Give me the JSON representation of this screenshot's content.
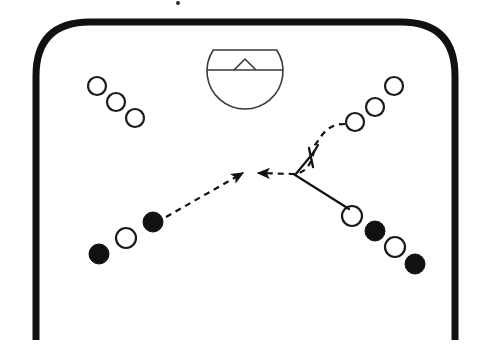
{
  "diagram": {
    "sport": "handball",
    "canvas": {
      "width": 487,
      "height": 364
    },
    "background_color": "#ffffff",
    "line_color": "#1a1a1a",
    "fill_color_filled_player": "#111111",
    "fill_color_open_player": "#ffffff"
  },
  "court": {
    "name": "court-outline",
    "description": "Thick rounded-top court boundary open at the bottom",
    "stroke_color": "#111111",
    "stroke_width": 7,
    "corner_radius": 54,
    "left_x": 36,
    "right_x": 455,
    "top_y": 22,
    "bottom_y": 340
  },
  "goal_area": {
    "name": "goal-area-shape",
    "description": "Circle with flat chord top, horizontal crossbar line and small triangular peak",
    "stroke_color": "#3a3a3a",
    "stroke_width": 1.6,
    "center_x": 245,
    "center_y": 71,
    "radius": 38,
    "flat_top_y": 50,
    "crossbar_y": 70,
    "peak_apex_x": 245,
    "peak_apex_y": 59,
    "peak_half_width": 11
  },
  "players": {
    "top_left_group": {
      "name": "top-left-open-players",
      "fill": "open",
      "radius": 9,
      "stroke_width": 2.2,
      "positions": [
        {
          "x": 97,
          "y": 86
        },
        {
          "x": 116,
          "y": 102
        },
        {
          "x": 135,
          "y": 118
        }
      ]
    },
    "top_right_group": {
      "name": "top-right-open-players",
      "fill": "open",
      "radius": 9,
      "stroke_width": 2.2,
      "positions": [
        {
          "x": 355,
          "y": 122
        },
        {
          "x": 375,
          "y": 107
        },
        {
          "x": 394,
          "y": 86
        }
      ]
    },
    "bottom_left_group": {
      "name": "bottom-left-players",
      "radius": 10,
      "stroke_width": 2.2,
      "positions": [
        {
          "x": 99,
          "y": 254,
          "fill": "filled"
        },
        {
          "x": 126,
          "y": 238,
          "fill": "open"
        },
        {
          "x": 153,
          "y": 222,
          "fill": "filled"
        }
      ]
    },
    "bottom_right_group": {
      "name": "bottom-right-players",
      "radius": 10,
      "stroke_width": 2.2,
      "positions": [
        {
          "x": 352,
          "y": 216,
          "fill": "open"
        },
        {
          "x": 375,
          "y": 231,
          "fill": "filled"
        },
        {
          "x": 395,
          "y": 247,
          "fill": "open"
        },
        {
          "x": 415,
          "y": 264,
          "fill": "filled"
        }
      ]
    }
  },
  "movement": {
    "pass_arrow_from_bottom_left": {
      "name": "dashed-pass-arrow-left",
      "style": "dashed",
      "dash_pattern": "6 5",
      "stroke_width": 2.2,
      "start": {
        "x": 166,
        "y": 217
      },
      "end": {
        "x": 243,
        "y": 173
      },
      "arrowhead": "at-end"
    },
    "dashed_run_right": {
      "name": "dashed-run-curve-right",
      "style": "dashed",
      "dash_pattern": "6 5",
      "stroke_width": 2.2,
      "path_points": [
        {
          "x": 345,
          "y": 124
        },
        {
          "x": 322,
          "y": 126
        },
        {
          "x": 315,
          "y": 145
        },
        {
          "x": 310,
          "y": 163
        },
        {
          "x": 292,
          "y": 174
        },
        {
          "x": 258,
          "y": 173
        }
      ],
      "arrowhead": "at-end"
    },
    "screen_mark": {
      "name": "screen-block-chevron",
      "style": "solid",
      "stroke_width": 2.2,
      "apex": {
        "x": 295,
        "y": 175
      },
      "upper_arm_end": {
        "x": 314,
        "y": 152
      },
      "tick_end": {
        "x": 318,
        "y": 145
      },
      "lower_arm_end": {
        "x": 349,
        "y": 209
      }
    }
  },
  "legend": {
    "open_circle_meaning": "attacking player",
    "filled_circle_meaning": "defending player",
    "dashed_arrow_meaning": "pass / ball movement",
    "solid_line_meaning": "player movement"
  },
  "stray_mark": {
    "name": "stray-dot",
    "x": 178,
    "y": 3,
    "radius": 2
  }
}
